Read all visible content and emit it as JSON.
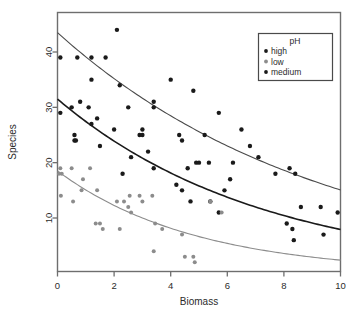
{
  "chart_data": {
    "type": "scatter",
    "title": "",
    "xlabel": "Biomass",
    "ylabel": "Species",
    "xlim": [
      0,
      10
    ],
    "ylim": [
      0,
      45
    ],
    "xticks": [
      0,
      2,
      4,
      6,
      8,
      10
    ],
    "yticks": [
      10,
      20,
      30,
      40
    ],
    "grid": false,
    "legend": {
      "title": "pH",
      "position": "top-right",
      "entries": [
        {
          "label": "high",
          "color": "#1a1a1a"
        },
        {
          "label": "low",
          "color": "#8c8c8c"
        },
        {
          "label": "medium",
          "color": "#1a1a1a"
        }
      ]
    },
    "series": [
      {
        "name": "high",
        "color": "#1a1a1a",
        "marker": "filled-circle",
        "points": [
          [
            0.1,
            39
          ],
          [
            0.7,
            39
          ],
          [
            1.2,
            39
          ],
          [
            1.7,
            39
          ],
          [
            1.2,
            35
          ],
          [
            2.1,
            44
          ],
          [
            2.2,
            34
          ],
          [
            3.4,
            31
          ],
          [
            3.4,
            30
          ],
          [
            4.0,
            35
          ],
          [
            2.5,
            30
          ],
          [
            4.8,
            33
          ],
          [
            5.7,
            29
          ],
          [
            5.2,
            25
          ],
          [
            6.5,
            26
          ],
          [
            6.8,
            23
          ],
          [
            7.2,
            36
          ],
          [
            7.1,
            21
          ],
          [
            7.7,
            18
          ],
          [
            8.4,
            18
          ],
          [
            8.2,
            19
          ],
          [
            3.0,
            26
          ],
          [
            2.0,
            26
          ],
          [
            4.3,
            25
          ],
          [
            4.4,
            24
          ]
        ]
      },
      {
        "name": "medium",
        "color": "#1a1a1a",
        "marker": "filled-circle",
        "points": [
          [
            0.1,
            29
          ],
          [
            0.5,
            30
          ],
          [
            0.8,
            31
          ],
          [
            1.1,
            30
          ],
          [
            1.2,
            27
          ],
          [
            1.4,
            28
          ],
          [
            1.5,
            23
          ],
          [
            0.6,
            24
          ],
          [
            0.65,
            24
          ],
          [
            0.6,
            25
          ],
          [
            2.3,
            18
          ],
          [
            2.6,
            21
          ],
          [
            2.9,
            25
          ],
          [
            3.0,
            25
          ],
          [
            3.2,
            22
          ],
          [
            3.4,
            19
          ],
          [
            4.2,
            16
          ],
          [
            4.4,
            15
          ],
          [
            4.7,
            13
          ],
          [
            4.9,
            20
          ],
          [
            5.0,
            20
          ],
          [
            5.35,
            20
          ],
          [
            5.4,
            13
          ],
          [
            5.7,
            11
          ],
          [
            6.1,
            17
          ],
          [
            6.2,
            20
          ],
          [
            5.9,
            15
          ],
          [
            4.6,
            19
          ],
          [
            8.1,
            9
          ],
          [
            8.3,
            8
          ],
          [
            8.35,
            6
          ],
          [
            9.4,
            7
          ],
          [
            8.6,
            12
          ],
          [
            9.3,
            12
          ],
          [
            9.9,
            11
          ]
        ]
      },
      {
        "name": "low",
        "color": "#8c8c8c",
        "marker": "filled-circle",
        "points": [
          [
            0.05,
            18
          ],
          [
            0.1,
            19
          ],
          [
            0.15,
            18
          ],
          [
            0.12,
            14
          ],
          [
            0.5,
            19
          ],
          [
            0.55,
            13
          ],
          [
            0.85,
            15
          ],
          [
            0.9,
            17
          ],
          [
            1.15,
            19
          ],
          [
            1.4,
            15
          ],
          [
            1.35,
            9
          ],
          [
            1.5,
            9
          ],
          [
            1.6,
            8
          ],
          [
            2.2,
            8
          ],
          [
            2.35,
            13
          ],
          [
            2.5,
            12
          ],
          [
            2.55,
            14
          ],
          [
            2.6,
            11
          ],
          [
            2.9,
            14
          ],
          [
            3.0,
            13
          ],
          [
            3.35,
            14
          ],
          [
            3.4,
            4
          ],
          [
            3.45,
            9
          ],
          [
            3.7,
            8
          ],
          [
            4.4,
            7
          ],
          [
            4.5,
            3
          ],
          [
            4.8,
            3
          ],
          [
            4.85,
            2
          ],
          [
            5.4,
            13
          ],
          [
            5.8,
            11
          ],
          [
            2.1,
            13
          ]
        ]
      }
    ],
    "fit_curves": [
      {
        "name": "high",
        "color": "#4a4a4a",
        "a": 43.5,
        "b": 0.106
      },
      {
        "name": "medium",
        "color": "#1a1a1a",
        "a": 31.5,
        "b": 0.138
      },
      {
        "name": "low",
        "color": "#8c8c8c",
        "a": 18.5,
        "b": 0.205
      }
    ]
  }
}
